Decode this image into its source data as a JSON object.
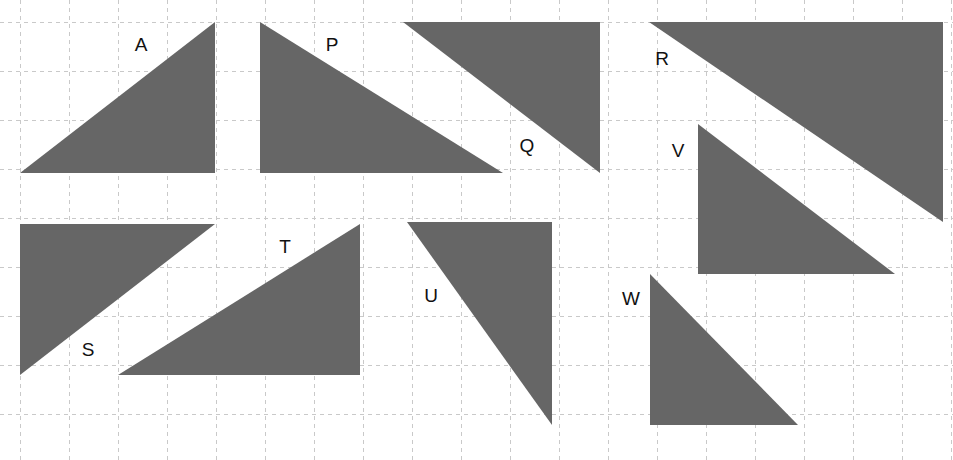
{
  "figure": {
    "width": 953,
    "height": 460,
    "background_color": "#ffffff"
  },
  "grid": {
    "cell_size": 49,
    "origin_x": 20,
    "origin_y": 22,
    "columns": 19,
    "rows": 9,
    "line_color": "#c9c9c9",
    "line_style": "dashed",
    "visible": true
  },
  "style": {
    "fill_color": "#666666",
    "label_color": "#111111",
    "label_font_size": 19
  },
  "chart_data": {
    "type": "diagram",
    "grid_unit_px": 49,
    "shapes": [
      {
        "label": "A",
        "type": "right-triangle",
        "points_px": "20,173 215,173 215,22",
        "label_x": 141,
        "label_y": 46,
        "base_units": 4,
        "height_units": 3,
        "area_units": 6
      },
      {
        "label": "P",
        "type": "right-triangle",
        "points_px": "260,22 260,173 503,173",
        "label_x": 332,
        "label_y": 46,
        "base_units": 5,
        "height_units": 3,
        "area_units": 7.5
      },
      {
        "label": "Q",
        "type": "right-triangle",
        "points_px": "403,22 600,22 600,173",
        "label_x": 527,
        "label_y": 147,
        "base_units": 4,
        "height_units": 3,
        "area_units": 6
      },
      {
        "label": "R",
        "type": "right-triangle",
        "points_px": "649,22 943,22 943,222",
        "label_x": 662,
        "label_y": 60,
        "base_units": 6,
        "height_units": 4,
        "area_units": 12
      },
      {
        "label": "S",
        "type": "right-triangle",
        "points_px": "20,224 215,224 20,375",
        "label_x": 88,
        "label_y": 351,
        "base_units": 4,
        "height_units": 3,
        "area_units": 6
      },
      {
        "label": "T",
        "type": "right-triangle",
        "points_px": "118,375 360,375 360,224",
        "label_x": 285,
        "label_y": 248,
        "base_units": 5,
        "height_units": 3,
        "area_units": 7.5
      },
      {
        "label": "U",
        "type": "right-triangle",
        "points_px": "407,222 552,222 552,425",
        "label_x": 431,
        "label_y": 297,
        "base_units": 3,
        "height_units": 4,
        "area_units": 6
      },
      {
        "label": "V",
        "type": "right-triangle",
        "points_px": "698,124 698,274 895,274",
        "label_x": 678,
        "label_y": 152,
        "base_units": 4,
        "height_units": 3,
        "area_units": 6
      },
      {
        "label": "W",
        "type": "right-triangle",
        "points_px": "650,274 650,425 798,425",
        "label_x": 631,
        "label_y": 300,
        "base_units": 3,
        "height_units": 3,
        "area_units": 4.5
      }
    ]
  }
}
